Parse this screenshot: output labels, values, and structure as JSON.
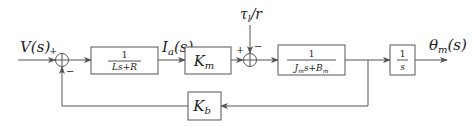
{
  "diagram": {
    "type": "block-diagram",
    "input": {
      "label_main": "V",
      "label_arg": "(s)"
    },
    "output": {
      "label_main": "θ",
      "label_sub": "m",
      "label_arg": "(s)"
    },
    "disturbance": {
      "label_main": "τ",
      "label_sub": "l",
      "label_rest": "/r"
    },
    "sum1": {
      "plus": "+",
      "minus": "−"
    },
    "sum2": {
      "plus": "+",
      "minus": "−"
    },
    "blocks": {
      "electrical": {
        "numerator": "1",
        "denominator": "Ls+R"
      },
      "torque_const": {
        "main": "K",
        "sub": "m"
      },
      "mechanical": {
        "numerator": "1",
        "den_a": "J",
        "den_a_sub": "m",
        "den_b": "s+B",
        "den_b_sub": "m"
      },
      "integrator": {
        "numerator": "1",
        "denominator": "s"
      },
      "back_emf": {
        "main": "K",
        "sub": "b"
      }
    },
    "signals": {
      "current": {
        "label_main": "I",
        "label_sub": "a",
        "label_arg": "(s)"
      }
    }
  }
}
